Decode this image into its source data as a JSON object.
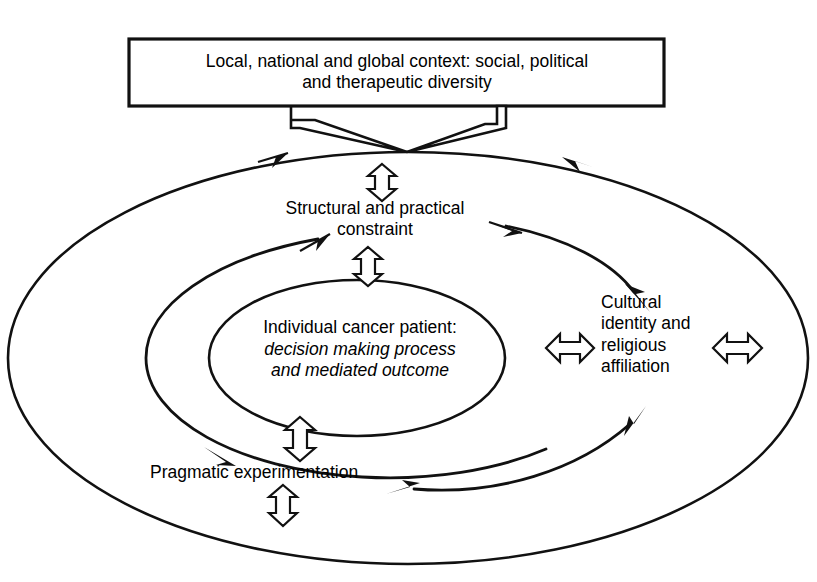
{
  "diagram": {
    "title_box": {
      "line1": "Local, national and global context: social, political",
      "line2": "and therapeutic diversity",
      "text": "Local, national and global context: social, political\nand therapeutic diversity"
    },
    "nodes": {
      "structural": {
        "line1": "Structural and practical",
        "line2": "constraint",
        "text": "Structural and practical\nconstraint"
      },
      "center": {
        "heading": "Individual cancer patient:",
        "italic_line1": "decision making process",
        "italic_line2": "and mediated outcome",
        "italic_text": "decision making process\nand mediated outcome"
      },
      "cultural": {
        "line1": "Cultural",
        "line2": "identity and",
        "line3": "religious",
        "line4": "affiliation",
        "text": "Cultural\nidentity and\nreligious\naffiliation"
      },
      "pragmatic": {
        "text": "Pragmatic experimentation"
      }
    },
    "colors": {
      "stroke": "#111111",
      "background": "#ffffff",
      "fill": "#ffffff"
    },
    "icons": {
      "double_arrow_vertical": "double-arrow-vertical-icon",
      "double_arrow_horizontal": "double-arrow-horizontal-icon",
      "curved_arrow": "curved-arrow-icon",
      "connector": "box-connector-icon"
    }
  }
}
